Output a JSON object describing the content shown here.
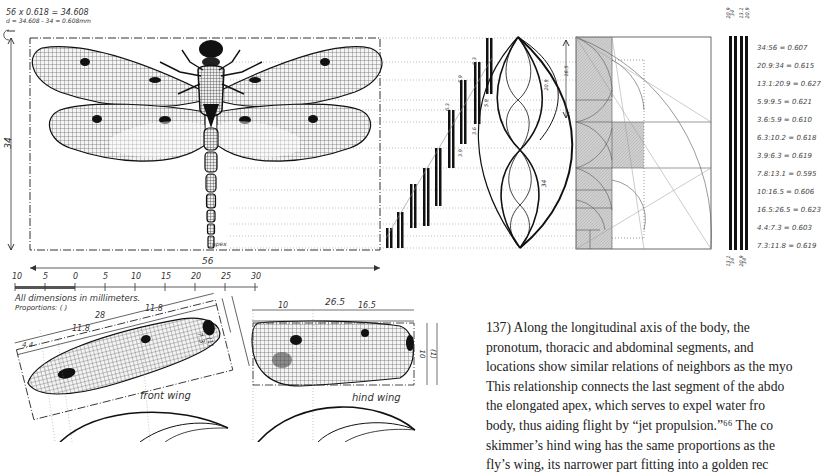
{
  "header_notes": {
    "line1": "56 x 0.618 = 34.608",
    "line2": "d = 34.608 - 34 = 0.608mm"
  },
  "dragon_fly": {
    "width_label": "56",
    "height_label": "34",
    "apex_label": "apex"
  },
  "scale": {
    "ticks": [
      "10",
      "5",
      "0",
      "5",
      "10",
      "15",
      "20",
      "25",
      "30"
    ],
    "note": "All dimensions in millimeters.",
    "proportions": "Proportions: ( )"
  },
  "front_wing": {
    "label": "front wing",
    "dims": [
      "28",
      "11.8",
      "11.8",
      "4.4",
      "7.3",
      "(1)"
    ]
  },
  "hind_wing": {
    "label": "hind wing",
    "dims": [
      "26.5",
      "10",
      "16.5",
      "10",
      "(1)"
    ]
  },
  "bars": {
    "labels": [
      "5.9",
      "6.3",
      "3.6",
      "5.9",
      "3.9",
      "6.3",
      "6.2",
      "3.6",
      "10.2",
      "5.9",
      "9.5",
      "16.5",
      "10.2",
      "26.5"
    ]
  },
  "spiral": {
    "labels": [
      "21",
      "13",
      "8",
      "5",
      "3",
      "2",
      "1",
      "34",
      "20.9",
      "16.5",
      "7.8",
      "10.2",
      "5.9"
    ]
  },
  "golden_grid": {
    "top_labels": [
      "20.9",
      "34",
      "13.1",
      "20.9"
    ],
    "bottom_labels": [
      "13.1",
      "34",
      "20.9",
      "34"
    ]
  },
  "ratios": [
    "34:56 = 0.607",
    "20.9:34 = 0.615",
    "13.1:20.9 = 0.627",
    "5.9:9.5 = 0.621",
    "3.6:5.9 = 0.610",
    "6.3:10.2 = 0.618",
    "3.9:6.3 = 0.619",
    "7.8:13.1 = 0.595",
    "10:16.5 = 0.606",
    "16.5:26.5 = 0.623",
    "4.4:7.3 = 0.603",
    "7.3:11.8 = 0.619"
  ],
  "caption": {
    "lines": [
      "137) Along the longitudinal axis of the body, the",
      "pronotum, thoracic and abdominal segments, and",
      "locations show similar relations of neighbors as the myo",
      "This relationship connects the last segment of the abdo",
      "the elongated apex, which serves to expel water fro",
      "body, thus aiding flight by “jet propulsion.”⁶⁶ The co",
      "skimmer’s hind wing has the same proportions as the",
      "fly’s wing, its narrower part fitting into a golden rec"
    ]
  }
}
